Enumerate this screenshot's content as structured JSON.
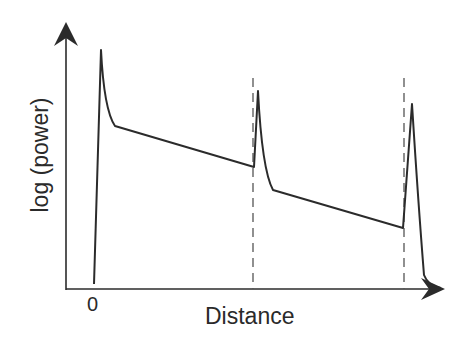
{
  "diagram": {
    "title": "",
    "x_axis": {
      "label": "Distance",
      "origin_tick": "0"
    },
    "y_axis": {
      "label": "log (power)"
    },
    "colors": {
      "trace": "#2b2b2b",
      "axes": "#2b2b2b",
      "dashed": "#555555",
      "text": "#2a2a2a"
    },
    "markers": [
      {
        "name": "boundary-1",
        "x_px": 253,
        "style": "dashed"
      },
      {
        "name": "boundary-2",
        "x_px": 404,
        "style": "dashed"
      }
    ],
    "trace_description": "Sawtooth profile: sharp peak followed by decay, linear decline, repeated at two dashed boundaries, ending with drop to baseline"
  }
}
